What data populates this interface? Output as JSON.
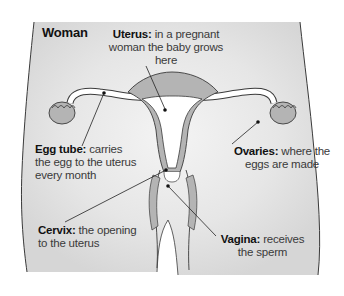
{
  "diagram": {
    "title": "Woman",
    "colors": {
      "body_fill": "#e4e4e4",
      "organ_fill": "#b4b4b4",
      "outline": "#3a3a3a",
      "inner_fill": "#ffffff",
      "text": "#3a3a3a",
      "bold_text": "#111111"
    },
    "labels": [
      {
        "id": "uterus",
        "term": "Uterus:",
        "lines": [
          "in a pregnant",
          "woman the baby grows",
          "here"
        ]
      },
      {
        "id": "egg-tube",
        "term": "Egg tube:",
        "lines": [
          "carries",
          "the egg to the uterus",
          "every month"
        ]
      },
      {
        "id": "ovaries",
        "term": "Ovaries:",
        "lines": [
          "where the",
          "eggs are made"
        ]
      },
      {
        "id": "cervix",
        "term": "Cervix:",
        "lines": [
          "the opening",
          "to the uterus"
        ]
      },
      {
        "id": "vagina",
        "term": "Vagina:",
        "lines": [
          "receives",
          "the sperm"
        ]
      }
    ]
  }
}
